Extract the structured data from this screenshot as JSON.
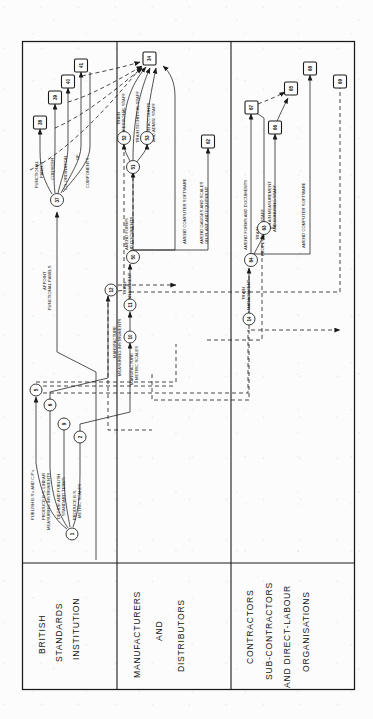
{
  "diagram": {
    "type": "pert-network",
    "orientation": "rotated-90-ccw",
    "background": "#fcfcfc",
    "ink": "#1a1a1a"
  },
  "swimlanes": [
    {
      "id": "bsi",
      "lines": [
        "BRITISH",
        "STANDARDS",
        "INSTITUTION"
      ]
    },
    {
      "id": "mfg",
      "lines": [
        "MANUFACTURERS",
        "AND",
        "DISTRIBUTORS"
      ]
    },
    {
      "id": "cont",
      "lines": [
        "CONTRACTORS",
        "SUB-CONTRACTORS",
        "AND DIRECT-LABOUR",
        "ORGANISATIONS"
      ]
    }
  ],
  "events": {
    "circles": [
      {
        "id": "1",
        "label": "1"
      },
      {
        "id": "2",
        "label": "2"
      },
      {
        "id": "5",
        "label": "5"
      },
      {
        "id": "6",
        "label": "6"
      },
      {
        "id": "9",
        "label": "9"
      },
      {
        "id": "10",
        "label": "10"
      },
      {
        "id": "11",
        "label": "11"
      },
      {
        "id": "12",
        "label": "12"
      },
      {
        "id": "14",
        "label": "14"
      },
      {
        "id": "37",
        "label": "37"
      },
      {
        "id": "50",
        "label": "50"
      },
      {
        "id": "51",
        "label": "51"
      },
      {
        "id": "52",
        "label": "52"
      },
      {
        "id": "53",
        "label": "53"
      },
      {
        "id": "63",
        "label": "63"
      },
      {
        "id": "64",
        "label": "64"
      }
    ],
    "squares": [
      {
        "id": "34",
        "label": "34"
      },
      {
        "id": "38",
        "label": "38"
      },
      {
        "id": "39",
        "label": "39"
      },
      {
        "id": "40",
        "label": "40"
      },
      {
        "id": "41",
        "label": "41"
      },
      {
        "id": "62",
        "label": "62"
      },
      {
        "id": "65",
        "label": "65"
      },
      {
        "id": "66",
        "label": "66"
      },
      {
        "id": "67",
        "label": "67"
      },
      {
        "id": "68",
        "label": "68"
      },
      {
        "id": "69",
        "label": "69"
      }
    ]
  },
  "activities": [
    {
      "id": "a1",
      "from": "1",
      "to": "5",
      "lane": "bsi",
      "lines": [
        "PUBLISH B.S's AND C.P's"
      ]
    },
    {
      "id": "a2",
      "from": "1",
      "to": "6",
      "lane": "bsi",
      "lines": [
        "PRODUCE B.S. LINEAR",
        "MEASURING INSTRUMENTS"
      ]
    },
    {
      "id": "a3",
      "from": "1",
      "to": "9",
      "lane": "bsi",
      "lines": [
        "DECIDE AND PUBLISH",
        "STANDARD TERMS"
      ]
    },
    {
      "id": "a4",
      "from": "1",
      "to": "2",
      "lane": "bsi",
      "lines": [
        "PRODUCE B.S.",
        "METRIC SCALES"
      ]
    },
    {
      "id": "a5",
      "from": "37",
      "to": "38",
      "lane": "bsi",
      "lines": [
        "FUNCTIONAL",
        "PANELS"
      ]
    },
    {
      "id": "a6",
      "from": "37",
      "to": "39",
      "lane": "bsi",
      "lines": [
        "CONSIDER"
      ]
    },
    {
      "id": "a7",
      "from": "37",
      "to": "40",
      "lane": "bsi",
      "lines": [
        "CO-ORDINATION"
      ]
    },
    {
      "id": "a8",
      "from": "37",
      "to": "41",
      "lane": "bsi",
      "lines": [
        "OF"
      ]
    },
    {
      "id": "a9",
      "from": "37",
      "to": "41",
      "lane": "bsi",
      "lines": [
        "COMPONENTS"
      ]
    },
    {
      "id": "a10",
      "from": "start",
      "to": "37",
      "lane": "bsi",
      "lines": [
        "APPOINT",
        "FUNCTIONAL PANELS"
      ]
    },
    {
      "id": "a11",
      "from": "6",
      "to": "12",
      "lane": "mfg",
      "lines": [
        "MANUFACTURE",
        "MEASURING INSTRUMENTS"
      ]
    },
    {
      "id": "a12",
      "from": "2",
      "to": "10",
      "lane": "mfg",
      "lines": [
        "MANUFACTURE",
        "METRIC SCALES"
      ]
    },
    {
      "id": "a13",
      "from": "11",
      "to": "50",
      "lane": "mfg",
      "lines": [
        "TRAIN",
        "MANAGEMENT"
      ]
    },
    {
      "id": "a14",
      "from": "50",
      "to": "51",
      "lane": "mfg",
      "lines": [
        "AMEND FORMS",
        "AND DOCUMENTS"
      ]
    },
    {
      "id": "a15",
      "from": "52",
      "to": "34",
      "lane": "mfg",
      "lines": [
        "TRAIN",
        "PROFESSIONAL STAFF"
      ]
    },
    {
      "id": "a16",
      "from": "51",
      "to": "34",
      "lane": "mfg",
      "lines": [
        "TRAIN TECHNICAL STAFF"
      ]
    },
    {
      "id": "a17",
      "from": "53",
      "to": "34",
      "lane": "mfg",
      "lines": [
        "TRAIN ACCOUNTS",
        "AND ADMIN. STAFF"
      ]
    },
    {
      "id": "a18",
      "from": "50",
      "to": "34",
      "lane": "mfg",
      "lines": [
        "AMEND COMPUTER SOFTWARE"
      ]
    },
    {
      "id": "a19",
      "from": "50",
      "to": "62",
      "lane": "mfg",
      "lines": [
        "AMEND GAUGES AND SCALES",
        "ON PLANT AND EQUIPMENT"
      ]
    },
    {
      "id": "a20",
      "from": "14",
      "to": "64",
      "lane": "cont",
      "lines": [
        "TRAIN",
        "MANAGEMENT"
      ]
    },
    {
      "id": "a21",
      "from": "64",
      "to": "67",
      "lane": "cont",
      "lines": [
        "AMEND FORMS AND DOCUMENTS"
      ]
    },
    {
      "id": "a22",
      "from": "64",
      "to": "63",
      "lane": "cont",
      "lines": [
        "TRAIN",
        "PROFESSIONAL STAFF"
      ]
    },
    {
      "id": "a23",
      "from": "63",
      "to": "66",
      "lane": "cont",
      "lines": [
        "TRAIN MEASUREMENT",
        "AND BONUSING STAFF"
      ]
    },
    {
      "id": "a24",
      "from": "64",
      "to": "68",
      "lane": "cont",
      "lines": [
        "AMEND COMPUTER SOFTWARE"
      ]
    }
  ]
}
